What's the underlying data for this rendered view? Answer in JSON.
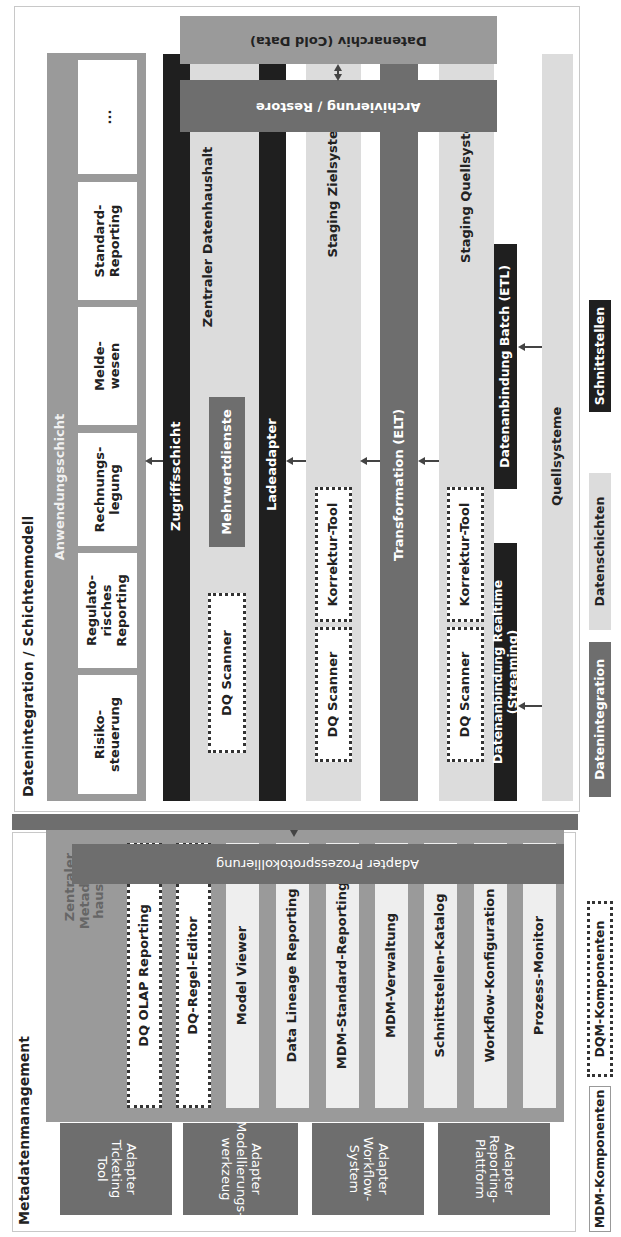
{
  "diagram": {
    "orientation": "rotated 90 degrees counter-clockwise",
    "metadata_section": {
      "title": "Metadatenmanagement",
      "hub_label": "Zentraler Metadaten-haushalt",
      "hub_lines": [
        "Zentraler",
        "Metadaten-",
        "haushalt"
      ],
      "dqm_components": [
        "DQ OLAP  Reporting",
        "DQ-Regel-Editor"
      ],
      "mdm_components": [
        "Model Viewer",
        "Data Lineage Reporting",
        "MDM-Standard-Reporting",
        "MDM-Verwaltung",
        "Schnittstellen-Katalog",
        "Workflow-Konfiguration",
        "Prozess-Monitor"
      ],
      "process_log_adapter": "Adapter Prozessprotokollierung",
      "adapters": [
        {
          "lines": [
            "Adapter",
            "Ticketing",
            "Tool"
          ]
        },
        {
          "lines": [
            "Adapter",
            "Modellierungs-",
            "werkzeug"
          ]
        },
        {
          "lines": [
            "Adapter",
            "Workflow-",
            "System"
          ]
        },
        {
          "lines": [
            "Adapter",
            "Reporting-",
            "Plattform"
          ]
        }
      ]
    },
    "integration_section": {
      "title": "Datenintegration / Schichtenmodell",
      "application_layer": {
        "label": "Anwendungsschicht",
        "items": [
          {
            "lines": [
              "Risiko-",
              "steuerung"
            ]
          },
          {
            "lines": [
              "Regulato-",
              "risches",
              "Reporting"
            ]
          },
          {
            "lines": [
              "Rechnungs-",
              "legung"
            ]
          },
          {
            "lines": [
              "Melde-",
              "wesen"
            ]
          },
          {
            "lines": [
              "Standard-",
              "Reporting"
            ]
          },
          {
            "lines": [
              "..."
            ]
          }
        ]
      },
      "access_layer": "Zugriffsschicht",
      "central_store": "Zentraler Datenhaushalt",
      "value_services": "Mehrwertdienste",
      "load_adapter": "Ladeadapter",
      "dq_scanner": "DQ Scanner",
      "correction_tool": "Korrektur-Tool",
      "staging_target": "Staging Zielsystem",
      "transformation": "Transformation (ELT)",
      "staging_source": "Staging Quellsystem",
      "realtime_connection": "Datenanbindung Realtime (Streaming)",
      "batch_connection": "Datenanbindung Batch (ETL)",
      "source_systems": "Quellsysteme",
      "archiving": "Archivierung / Restore",
      "archive": "Datenarchiv (Cold Data)"
    },
    "legend": {
      "integration": "Datenintegration",
      "data_layers": "Datenschichten",
      "interfaces": "Schnittstellen",
      "mdm": "MDM-Komponenten",
      "dqm": "DQM-Komponenten"
    },
    "colors": {
      "dark_gray": "#6e6e6e",
      "mid_gray": "#9a9a9a",
      "light_gray": "#dcdcdc",
      "black": "#1f1f1f",
      "white": "#ffffff"
    }
  }
}
